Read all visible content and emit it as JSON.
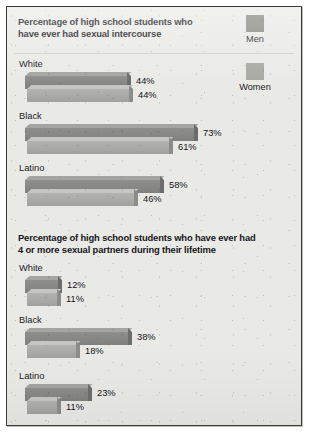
{
  "figure": {
    "legend": {
      "entries": [
        {
          "label": "Men",
          "color": "#87877f",
          "swatch_name": "men-swatch"
        },
        {
          "label": "Women",
          "color": "#a9a9a3",
          "swatch_name": "women-swatch"
        }
      ]
    }
  },
  "chart_data": [
    {
      "type": "bar",
      "orientation": "horizontal",
      "title": "Percentage of high school students who\nhave ever had sexual intercourse",
      "xlabel": "",
      "ylabel": "",
      "units": "%",
      "categories": [
        "White",
        "Black",
        "Latino"
      ],
      "series": [
        {
          "name": "Men",
          "color": "#87877f",
          "values": [
            44,
            73,
            58
          ],
          "labels": [
            "44%",
            "73%",
            "58%"
          ]
        },
        {
          "name": "Women",
          "color": "#a9a9a3",
          "values": [
            44,
            61,
            46
          ],
          "labels": [
            "44%",
            "61%",
            "46%"
          ]
        }
      ],
      "legend_position": "top-right",
      "grid": false,
      "xlim": [
        0,
        80
      ],
      "px_per_unit": 2.32
    },
    {
      "type": "bar",
      "orientation": "horizontal",
      "title": "Percentage of high school students who have ever had\n4 or more sexual partners during their lifetime",
      "xlabel": "",
      "ylabel": "",
      "units": "%",
      "categories": [
        "White",
        "Black",
        "Latino"
      ],
      "series": [
        {
          "name": "Men",
          "color": "#87877f",
          "values": [
            12,
            38,
            23
          ],
          "labels": [
            "12%",
            "38%",
            "23%"
          ]
        },
        {
          "name": "Women",
          "color": "#a9a9a3",
          "values": [
            11,
            18,
            11
          ],
          "labels": [
            "11%",
            "18%",
            "11%"
          ]
        }
      ],
      "legend_position": "none",
      "grid": false,
      "xlim": [
        0,
        45
      ],
      "px_per_unit": 2.72
    }
  ]
}
